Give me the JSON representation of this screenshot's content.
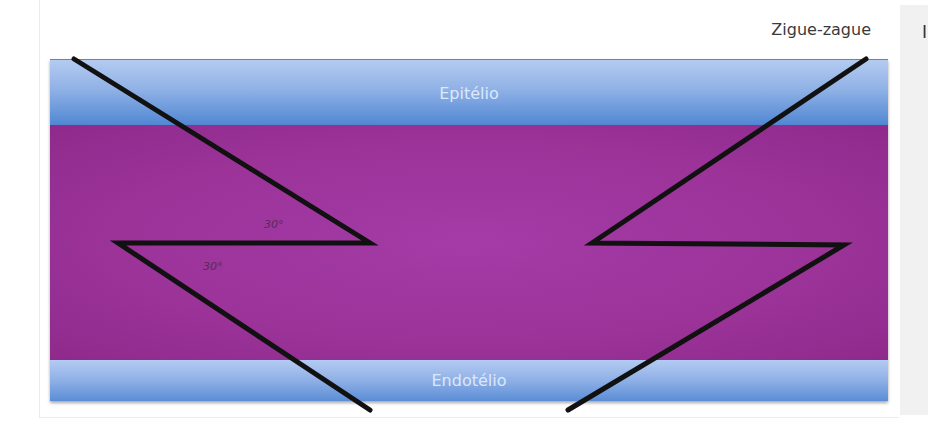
{
  "figure": {
    "title": "Zigue-zague",
    "side_panel_glyph": "I",
    "layers": [
      {
        "name": "epithelium",
        "label": "Epitélio",
        "color": "#8fb1e6"
      },
      {
        "name": "stroma",
        "label": "",
        "color": "#9b3399"
      },
      {
        "name": "endothelium",
        "label": "Endotélio",
        "color": "#8fb0e6"
      }
    ],
    "incisions": [
      {
        "side": "left",
        "shape": "zigzag",
        "angles": [
          "30°",
          "30°"
        ]
      },
      {
        "side": "right",
        "shape": "zigzag",
        "angles": []
      }
    ],
    "line_color": "#111111"
  }
}
